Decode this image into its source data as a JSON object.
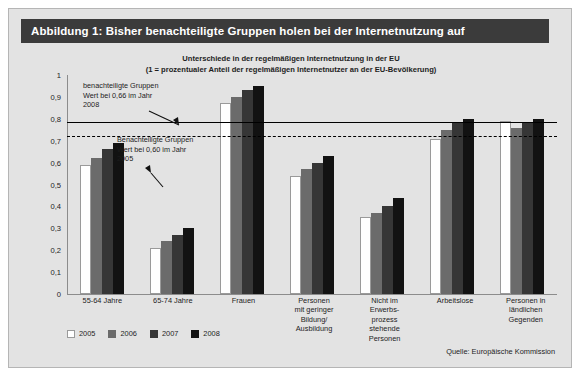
{
  "figure": {
    "header_title": "Abbildung 1: Bisher benachteiligte Gruppen holen bei der Internetnutzung auf",
    "subtitle_line1": "Unterschiede in der regelmäßigen Internetnutzung in der EU",
    "subtitle_line2": "(1 = prozentualer Anteil der regelmäßigen Internetnutzer an der EU-Bevölkerung)",
    "source": "Quelle: Europäische Kommission",
    "header_bg": "#3b3b3b",
    "panel_bg": "#e3e3e3"
  },
  "annotations": [
    {
      "id": "annotation-2008",
      "text": "benachteiligte Gruppen\nWert bei 0,66 im Jahr\n2008",
      "value": 0.66
    },
    {
      "id": "annotation-2005",
      "text": "Benachteiligte Gruppen\nWert bei 0,60 im Jahr\n2005",
      "value": 0.6
    }
  ],
  "reference_lines": [
    {
      "id": "refline-solid",
      "style": "solid",
      "y": 0.785
    },
    {
      "id": "refline-dashed",
      "style": "dashed",
      "y": 0.722
    }
  ],
  "chart_data": {
    "type": "bar",
    "title": "Unterschiede in der regelmäßigen Internetnutzung in der EU",
    "subtitle": "(1 = prozentualer Anteil der regelmäßigen Internetnutzer an der EU-Bevölkerung)",
    "xlabel": "",
    "ylabel": "",
    "ylim": [
      0,
      1
    ],
    "ytick_labels": [
      "1",
      "0,9",
      "0,8",
      "0,7",
      "0,6",
      "0,5",
      "0,4",
      "0,3",
      "0,2",
      "0,1",
      "0"
    ],
    "ytick_values": [
      1,
      0.9,
      0.8,
      0.7,
      0.6,
      0.5,
      0.4,
      0.3,
      0.2,
      0.1,
      0
    ],
    "grid": false,
    "legend_position": "bottom-left",
    "categories": [
      "55-64 Jahre",
      "65-74 Jahre",
      "Frauen",
      "Personen\nmit geringer\nBildung/\nAusbildung",
      "Nicht im\nErwerbs-\nprozess\nstehende\nPersonen",
      "Arbeitslose",
      "Personen in\nländlichen\nGegenden"
    ],
    "series": [
      {
        "name": "2005",
        "color": "#ffffff",
        "values": [
          0.59,
          0.21,
          0.87,
          0.54,
          0.35,
          0.71,
          0.79
        ]
      },
      {
        "name": "2006",
        "color": "#6b6b6b",
        "values": [
          0.62,
          0.24,
          0.9,
          0.57,
          0.37,
          0.75,
          0.76
        ]
      },
      {
        "name": "2007",
        "color": "#363636",
        "values": [
          0.66,
          0.27,
          0.93,
          0.6,
          0.4,
          0.78,
          0.78
        ]
      },
      {
        "name": "2008",
        "color": "#121212",
        "values": [
          0.69,
          0.3,
          0.95,
          0.63,
          0.44,
          0.8,
          0.8
        ]
      }
    ]
  }
}
